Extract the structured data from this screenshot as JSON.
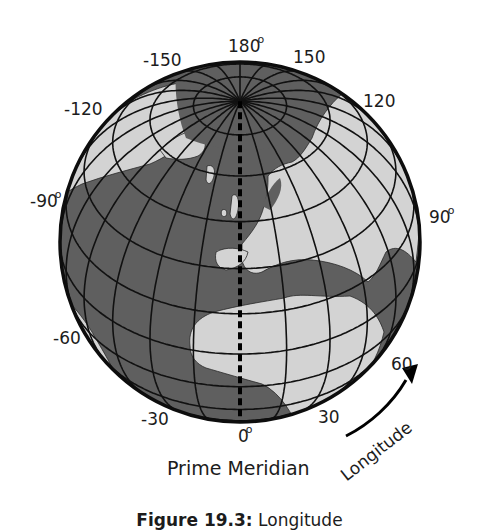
{
  "figure": {
    "caption_number": "Figure 19.3:",
    "caption_text": "Longitude",
    "prime_meridian_label": "Prime Meridian",
    "arrow_label": "Longitude",
    "degree_symbol": "o"
  },
  "globe": {
    "center_x": 240,
    "center_y": 242,
    "radius": 180,
    "tilt_deg": 38.5,
    "meridian_step_deg": 15,
    "parallel_step_deg": 15,
    "colors": {
      "ocean": "#5f5f5f",
      "land": "#d3d3d3",
      "grid": "#111111",
      "outline": "#0d0d0d"
    }
  },
  "longitude_labels": [
    {
      "text": "180",
      "x": 228,
      "y": 38,
      "degree": true
    },
    {
      "text": "-150",
      "x": 143,
      "y": 52,
      "degree": false
    },
    {
      "text": "150",
      "x": 293,
      "y": 49,
      "degree": false
    },
    {
      "text": "-120",
      "x": 64,
      "y": 101,
      "degree": false
    },
    {
      "text": "120",
      "x": 363,
      "y": 93,
      "degree": false
    },
    {
      "text": "-90",
      "x": 30,
      "y": 193,
      "degree": true
    },
    {
      "text": "90",
      "x": 429,
      "y": 209,
      "degree": true
    },
    {
      "text": "-60",
      "x": 53,
      "y": 330,
      "degree": false
    },
    {
      "text": "60",
      "x": 391,
      "y": 356,
      "degree": false
    },
    {
      "text": "-30",
      "x": 141,
      "y": 411,
      "degree": false
    },
    {
      "text": "30",
      "x": 318,
      "y": 409,
      "degree": false
    },
    {
      "text": "0",
      "x": 238,
      "y": 428,
      "degree": true
    }
  ],
  "chart_data": {
    "type": "diagram",
    "title": "Figure 19.3: Longitude",
    "projection": "orthographic",
    "meridian_labels_deg": [
      180,
      150,
      120,
      90,
      60,
      30,
      0,
      -30,
      -60,
      -90,
      -120,
      -150
    ],
    "highlighted_meridian": {
      "value": 0,
      "label": "Prime Meridian",
      "style": "dashed"
    },
    "annotations": [
      "Prime Meridian",
      "Longitude (curved arrow, increasing eastward)"
    ]
  }
}
